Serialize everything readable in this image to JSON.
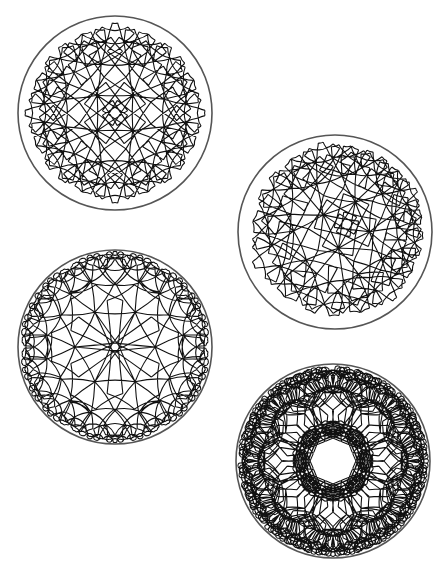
{
  "figure": {
    "background": "#ffffff",
    "stroke_color": "#111111",
    "boundary_color": "#555555",
    "caption": ""
  },
  "disks": [
    {
      "id": "disk-1",
      "label": "Poincaré disk tiling, square central tile",
      "cx": 115,
      "cy": 113,
      "r": 97,
      "p": 4,
      "q": 5,
      "rotation": 45,
      "depth": 4
    },
    {
      "id": "disk-2",
      "label": "Poincaré disk tiling, rotated square central tile",
      "cx": 335,
      "cy": 232,
      "r": 97,
      "p": 4,
      "q": 5,
      "rotation": 20,
      "depth": 4,
      "offset": [
        0.12,
        -0.08
      ]
    },
    {
      "id": "disk-3",
      "label": "Poincaré disk tiling, hexagonal central tile",
      "cx": 115,
      "cy": 347,
      "r": 97,
      "p": 6,
      "q": 4,
      "rotation": 0,
      "depth": 3
    },
    {
      "id": "disk-4",
      "label": "Poincaré disk tiling, octagonal central tile",
      "cx": 333,
      "cy": 461,
      "r": 97,
      "p": 8,
      "q": 3,
      "rotation": 22.5,
      "depth": 3
    }
  ]
}
